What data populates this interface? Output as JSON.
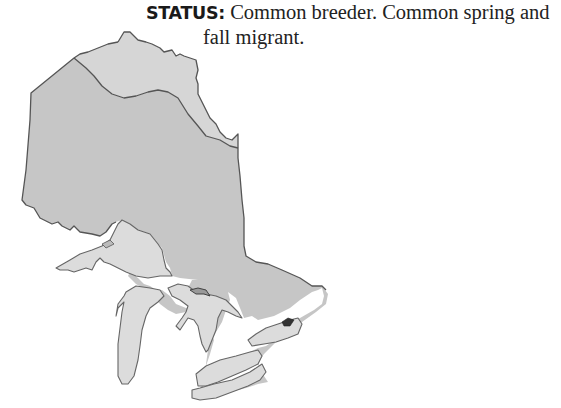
{
  "status": {
    "label": "STATUS:",
    "text_line1": " Common breeder. Common spring and",
    "text_line2": "fall migrant."
  },
  "map": {
    "region": "Ontario range map",
    "legend_colors": {
      "north_region": "#d6d6d6",
      "south_region": "#c6c6c6",
      "lakes": "#dcdcdc",
      "border": "#555555"
    }
  }
}
